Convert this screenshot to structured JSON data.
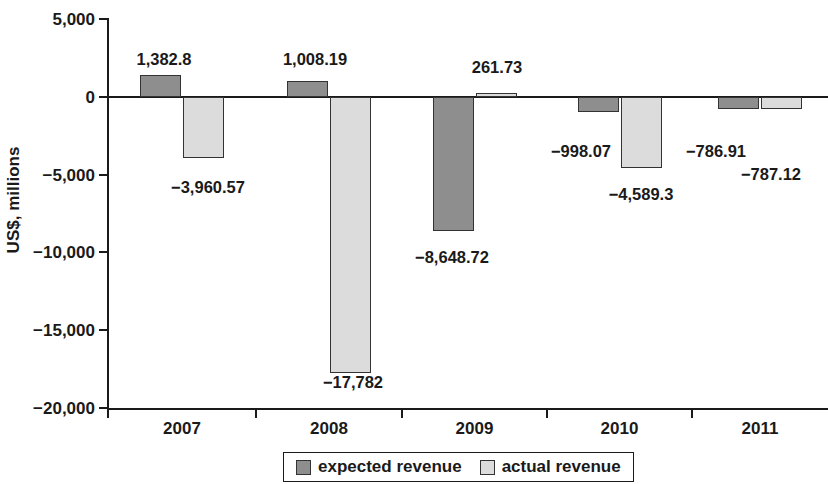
{
  "chart_data": {
    "type": "bar",
    "title": "",
    "subtitle": "",
    "xlabel": "",
    "ylabel": "US$, millions",
    "categories": [
      "2007",
      "2008",
      "2009",
      "2010",
      "2011"
    ],
    "ylim": [
      -20000,
      5000
    ],
    "yticks": [
      5000,
      0,
      -5000,
      -10000,
      -15000,
      -20000
    ],
    "ytick_labels": [
      "5,000",
      "0",
      "−5,000",
      "−10,000",
      "−15,000",
      "−20,000"
    ],
    "grid": false,
    "legend_position": "bottom-center",
    "series": [
      {
        "name": "expected revenue",
        "color": "#8e8e8e",
        "values": [
          1382.8,
          1008.19,
          -8648.72,
          -998.07,
          -786.91
        ],
        "data_labels": [
          "1,382.8",
          "1,008.19",
          "−8,648.72",
          "−998.07",
          "−786.91"
        ]
      },
      {
        "name": "actual revenue",
        "color": "#dcdcdc",
        "values": [
          -3960.57,
          -17782,
          261.73,
          -4589.3,
          -787.12
        ],
        "data_labels": [
          "−3,960.57",
          "−17,782",
          "261.73",
          "−4,589.3",
          "−787.12"
        ]
      }
    ]
  },
  "axis": {
    "y_title": "US$, millions",
    "y_tick_labels": [
      "5,000",
      "0",
      "−5,000",
      "−10,000",
      "−15,000",
      "−20,000"
    ],
    "x_tick_labels": [
      "2007",
      "2008",
      "2009",
      "2010",
      "2011"
    ]
  },
  "legend": {
    "entries": [
      {
        "label": "expected revenue",
        "swatch": "expected"
      },
      {
        "label": "actual revenue",
        "swatch": "actual"
      }
    ]
  },
  "colors": {
    "expected": "#8e8e8e",
    "actual": "#dcdcdc",
    "axis": "#1a1a1a",
    "background": "#ffffff"
  }
}
